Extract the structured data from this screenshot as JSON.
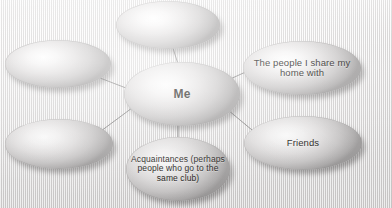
{
  "diagram": {
    "background_color": "#eceaea",
    "node_fill_light": "#ffffff",
    "node_fill_dark": "#a09e9e",
    "connector_color": "#5f5d5d",
    "text_color": "#14120f",
    "nodes": [
      {
        "id": "top",
        "label": "",
        "empty": true
      },
      {
        "id": "left",
        "label": "",
        "empty": true
      },
      {
        "id": "center",
        "label": "Me",
        "empty": false
      },
      {
        "id": "home",
        "label": "The people I share my home with",
        "empty": false
      },
      {
        "id": "bottomleft",
        "label": "",
        "empty": true
      },
      {
        "id": "friends",
        "label": "Friends",
        "empty": false
      },
      {
        "id": "acquaintances",
        "label": "Acquaintances (perhaps people who go to the same club)",
        "empty": false
      }
    ],
    "connections": [
      {
        "from": "center",
        "to": "top"
      },
      {
        "from": "center",
        "to": "left"
      },
      {
        "from": "center",
        "to": "home"
      },
      {
        "from": "center",
        "to": "bottomleft"
      },
      {
        "from": "center",
        "to": "friends"
      },
      {
        "from": "center",
        "to": "acquaintances"
      }
    ]
  }
}
